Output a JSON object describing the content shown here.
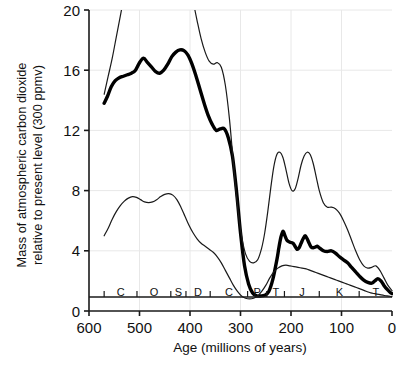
{
  "chart_data": {
    "type": "line",
    "title": "",
    "xlabel": "Age (millions of years)",
    "ylabel": "Mass of atmospheric carbon dioxide relative to present level (300 ppmv)",
    "ylabel_line1": "Mass of atmospheric carbon dioxide",
    "ylabel_line2": "relative to present level (300 ppmv)",
    "xlim": [
      600,
      0
    ],
    "ylim": [
      0,
      20
    ],
    "x_reversed": true,
    "grid": true,
    "legend": "none",
    "xticks": [
      600,
      500,
      400,
      300,
      200,
      100,
      0
    ],
    "xtick_labels": [
      "600",
      "500",
      "400",
      "300",
      "200",
      "100",
      "0"
    ],
    "yticks": [
      0,
      4,
      8,
      12,
      16,
      20
    ],
    "ytick_labels": [
      "0",
      "4",
      "8",
      "12",
      "16",
      "20"
    ],
    "period_axis_name": "geological periods",
    "period_boundaries": [
      570,
      505,
      438,
      408,
      360,
      286,
      248,
      213,
      144,
      65,
      0
    ],
    "periods": [
      {
        "label": "C",
        "name": "Cambrian",
        "start": 570,
        "end": 505,
        "mid": 537
      },
      {
        "label": "O",
        "name": "Ordovician",
        "start": 505,
        "end": 438,
        "mid": 471
      },
      {
        "label": "S",
        "name": "Silurian",
        "start": 438,
        "end": 408,
        "mid": 423
      },
      {
        "label": "D",
        "name": "Devonian",
        "start": 408,
        "end": 360,
        "mid": 384
      },
      {
        "label": "C",
        "name": "Carboniferous",
        "start": 360,
        "end": 286,
        "mid": 323
      },
      {
        "label": "P",
        "name": "Permian",
        "start": 286,
        "end": 248,
        "mid": 267
      },
      {
        "label": "T",
        "name": "Triassic",
        "start": 248,
        "end": 213,
        "mid": 230
      },
      {
        "label": "J",
        "name": "Jurassic",
        "start": 213,
        "end": 144,
        "mid": 178
      },
      {
        "label": "K",
        "name": "Cretaceous",
        "start": 144,
        "end": 65,
        "mid": 104
      },
      {
        "label": "T",
        "name": "Tertiary",
        "start": 65,
        "end": 0,
        "mid": 32
      }
    ],
    "series": [
      {
        "name": "best estimate",
        "style": "thick",
        "color": "#000000",
        "width": 3.4,
        "x": [
          570,
          563,
          556,
          548,
          540,
          532,
          524,
          516,
          508,
          500,
          492,
          484,
          476,
          468,
          460,
          452,
          444,
          436,
          428,
          420,
          412,
          404,
          396,
          388,
          380,
          372,
          364,
          356,
          348,
          340,
          332,
          324,
          316,
          308,
          300,
          292,
          284,
          276,
          268,
          260,
          252,
          244,
          236,
          228,
          224,
          220,
          216,
          212,
          208,
          204,
          200,
          196,
          192,
          188,
          184,
          180,
          176,
          172,
          168,
          164,
          160,
          156,
          152,
          148,
          144,
          136,
          128,
          120,
          112,
          104,
          96,
          88,
          80,
          72,
          64,
          56,
          48,
          40,
          34,
          28,
          22,
          16,
          10,
          4,
          0
        ],
        "y": [
          13.8,
          14.3,
          14.9,
          15.3,
          15.5,
          15.6,
          15.7,
          15.8,
          16.0,
          16.5,
          16.8,
          16.5,
          16.2,
          15.9,
          15.8,
          16.0,
          16.4,
          16.9,
          17.2,
          17.35,
          17.3,
          17.0,
          16.4,
          15.6,
          14.7,
          13.8,
          13.0,
          12.4,
          12.0,
          12.1,
          12.1,
          11.5,
          10.3,
          8.0,
          5.2,
          3.0,
          1.8,
          1.2,
          1.0,
          1.0,
          1.05,
          1.3,
          2.1,
          3.4,
          4.2,
          4.9,
          5.3,
          5.0,
          4.7,
          4.6,
          4.55,
          4.5,
          4.3,
          4.1,
          4.2,
          4.5,
          4.8,
          5.0,
          4.8,
          4.5,
          4.25,
          4.2,
          4.25,
          4.3,
          4.2,
          4.0,
          3.95,
          4.0,
          3.85,
          3.6,
          3.4,
          3.2,
          2.9,
          2.6,
          2.3,
          2.05,
          1.9,
          1.85,
          2.0,
          2.15,
          2.0,
          1.7,
          1.45,
          1.25,
          1.15
        ],
        "note": "Central best-estimate curve (heavy line)"
      },
      {
        "name": "upper bound",
        "style": "thin",
        "color": "#1a1a1a",
        "width": 1.2,
        "clipped_top": true,
        "x": [
          570,
          562,
          554,
          546,
          538,
          530,
          522,
          514,
          506,
          498,
          490,
          482,
          474,
          466,
          458,
          450,
          442,
          434,
          426,
          418,
          410,
          402,
          394,
          386,
          378,
          370,
          362,
          354,
          346,
          338,
          330,
          322,
          314,
          306,
          298,
          290,
          282,
          274,
          266,
          258,
          252,
          246,
          240,
          234,
          228,
          222,
          216,
          210,
          204,
          198,
          192,
          186,
          180,
          174,
          168,
          162,
          156,
          150,
          144,
          136,
          128,
          120,
          112,
          104,
          96,
          88,
          80,
          72,
          64,
          56,
          48,
          40,
          32,
          24,
          16,
          8,
          0
        ],
        "y": [
          14.4,
          15.6,
          16.8,
          18.2,
          19.6,
          21.0,
          22.3,
          23.2,
          23.8,
          24.0,
          23.9,
          23.6,
          23.2,
          22.9,
          22.8,
          22.9,
          23.2,
          23.5,
          23.6,
          23.4,
          22.8,
          21.8,
          20.6,
          19.3,
          18.1,
          17.2,
          16.6,
          16.4,
          16.5,
          16.2,
          15.0,
          12.8,
          9.8,
          7.0,
          5.0,
          3.8,
          3.3,
          3.2,
          3.4,
          4.2,
          5.2,
          6.6,
          8.2,
          9.6,
          10.4,
          10.55,
          10.2,
          9.4,
          8.5,
          8.0,
          8.1,
          8.8,
          9.7,
          10.3,
          10.55,
          10.4,
          9.8,
          8.9,
          8.0,
          7.2,
          6.9,
          6.9,
          6.8,
          6.5,
          6.0,
          5.4,
          4.7,
          4.0,
          3.4,
          3.0,
          2.85,
          2.9,
          3.0,
          2.7,
          2.2,
          1.7,
          1.35
        ],
        "note": "Upper uncertainty envelope; exits top of plot between ~540 and ~330 Ma"
      },
      {
        "name": "lower bound",
        "style": "thin",
        "color": "#1a1a1a",
        "width": 1.2,
        "x": [
          570,
          562,
          554,
          546,
          538,
          530,
          522,
          514,
          506,
          498,
          490,
          482,
          474,
          466,
          458,
          450,
          442,
          434,
          426,
          418,
          410,
          402,
          394,
          386,
          378,
          370,
          362,
          354,
          346,
          338,
          330,
          322,
          314,
          306,
          298,
          290,
          282,
          274,
          266,
          258,
          250,
          242,
          234,
          226,
          218,
          210,
          202,
          194,
          186,
          178,
          170,
          162,
          154,
          146,
          138,
          130,
          122,
          114,
          106,
          98,
          90,
          82,
          74,
          66,
          58,
          50,
          42,
          34,
          26,
          18,
          10,
          4,
          0
        ],
        "y": [
          5.0,
          5.5,
          6.1,
          6.6,
          7.0,
          7.3,
          7.5,
          7.6,
          7.55,
          7.4,
          7.25,
          7.2,
          7.25,
          7.4,
          7.6,
          7.75,
          7.8,
          7.7,
          7.4,
          6.9,
          6.3,
          5.7,
          5.2,
          4.8,
          4.5,
          4.3,
          4.1,
          3.9,
          3.6,
          3.2,
          2.7,
          2.2,
          1.7,
          1.3,
          1.0,
          0.85,
          0.8,
          0.85,
          1.0,
          1.3,
          1.7,
          2.2,
          2.6,
          2.85,
          3.0,
          3.05,
          3.0,
          2.95,
          2.9,
          2.85,
          2.8,
          2.7,
          2.6,
          2.5,
          2.4,
          2.3,
          2.2,
          2.1,
          2.0,
          1.9,
          1.8,
          1.7,
          1.6,
          1.5,
          1.4,
          1.3,
          1.2,
          1.15,
          1.1,
          1.05,
          1.0,
          0.98,
          0.95
        ],
        "note": "Lower uncertainty envelope"
      }
    ],
    "colors": {
      "axis": "#1a1a1a",
      "grid": "#e8e8e8",
      "curve_main": "#000000",
      "curve_envelope": "#1a1a1a",
      "background": "#ffffff"
    }
  }
}
